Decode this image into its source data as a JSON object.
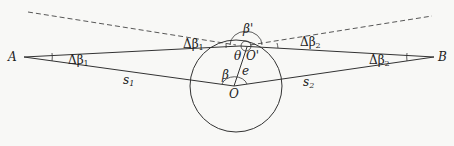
{
  "diagram": {
    "points": {
      "A": {
        "label": "A",
        "x": 24,
        "y": 57
      },
      "B": {
        "label": "B",
        "x": 434,
        "y": 57
      },
      "O": {
        "label": "O",
        "x": 234,
        "y": 86
      },
      "O_prime": {
        "label": "O'",
        "x": 244,
        "y": 46
      }
    },
    "circle": {
      "cx": 236,
      "cy": 86,
      "r": 46
    },
    "labels": {
      "delta_beta1_top": "Δβ",
      "delta_beta1_top_sub": "1",
      "delta_beta1_A": "Δβ",
      "delta_beta1_A_sub": "1",
      "delta_beta2_top": "Δβ",
      "delta_beta2_top_sub": "2",
      "delta_beta2_B": "Δβ",
      "delta_beta2_B_sub": "2",
      "beta_prime": "β'",
      "theta": "θ",
      "beta": "β",
      "e": "e",
      "s1": "s",
      "s1_sub": "1",
      "s2": "s",
      "s2_sub": "2",
      "A": "A",
      "B": "B",
      "O": "O",
      "O_prime": "O'"
    },
    "colors": {
      "stroke": "#333333",
      "background": "#f8f8f6"
    }
  }
}
